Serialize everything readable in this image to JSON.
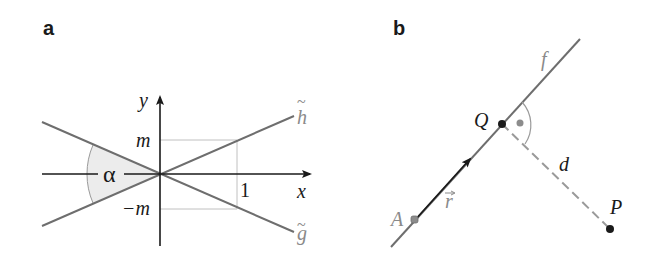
{
  "panel_a": {
    "label": "a",
    "axis_x_label": "x",
    "axis_y_label": "y",
    "tick_m": "m",
    "tick_neg_m": "−m",
    "tick_one": "1",
    "angle_label": "α",
    "line_h_label": "h",
    "line_g_label": "g",
    "tilde": "~"
  },
  "panel_b": {
    "label": "b",
    "line_label": "f",
    "point_Q": "Q",
    "point_A": "A",
    "point_P": "P",
    "vector_label": "r",
    "distance_label": "d"
  },
  "colors": {
    "line_gray": "#6e6e6e",
    "axis": "#1a1a1a",
    "guide": "#c0c0c0",
    "angle_fill": "#ececec",
    "dashed": "#9a9a9a",
    "point_dark": "#1a1a1a",
    "point_gray": "#8c8c8c"
  }
}
